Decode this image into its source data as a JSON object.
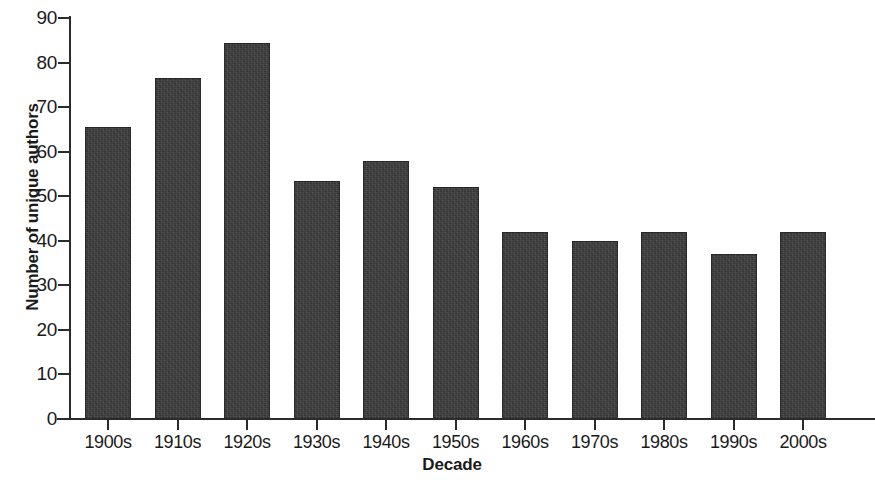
{
  "chart_data": {
    "type": "bar",
    "title": "",
    "xlabel": "Decade",
    "ylabel": "Number of unique authors",
    "categories": [
      "1900s",
      "1910s",
      "1920s",
      "1930s",
      "1940s",
      "1950s",
      "1960s",
      "1970s",
      "1980s",
      "1990s",
      "2000s"
    ],
    "values": [
      65.5,
      76.5,
      84.5,
      53.5,
      58,
      52,
      42,
      40,
      42,
      37,
      42
    ],
    "ylim": [
      0,
      90
    ],
    "yticks": [
      0,
      10,
      20,
      30,
      40,
      50,
      60,
      70,
      80,
      90
    ],
    "ytick_labels": [
      "0",
      "10",
      "20",
      "30",
      "40",
      "50",
      "60",
      "70",
      "80",
      "90"
    ],
    "grid": false,
    "legend": null,
    "bar_color": "#3b3b3b",
    "axis_color": "#2b2b2b",
    "background_color": "#ffffff"
  }
}
